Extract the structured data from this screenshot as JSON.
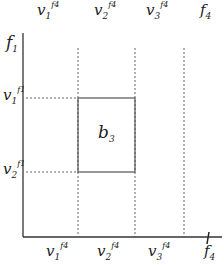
{
  "diagram": {
    "type": "partition-grid",
    "top_labels": [
      {
        "base": "v",
        "sub": "1",
        "sup": "f4"
      },
      {
        "base": "v",
        "sub": "2",
        "sup": "f4"
      },
      {
        "base": "v",
        "sub": "3",
        "sup": "f4"
      },
      {
        "base": "f",
        "sub": "4",
        "sup": ""
      }
    ],
    "left_labels": [
      {
        "base": "f",
        "sub": "1",
        "sup": ""
      },
      {
        "base": "v",
        "sub": "1",
        "sup": "f1"
      },
      {
        "base": "v",
        "sub": "2",
        "sup": "f1"
      }
    ],
    "bottom_labels": [
      {
        "base": "v",
        "sub": "1",
        "sup": "f4"
      },
      {
        "base": "v",
        "sub": "2",
        "sup": "f4"
      },
      {
        "base": "v",
        "sub": "3",
        "sup": "f4"
      },
      {
        "base": "f",
        "sub": "4",
        "sup": ""
      }
    ],
    "box_label": {
      "base": "b",
      "sub": "3"
    },
    "colors": {
      "line": "#333333",
      "dashed": "#555555",
      "box": "#444444"
    }
  }
}
